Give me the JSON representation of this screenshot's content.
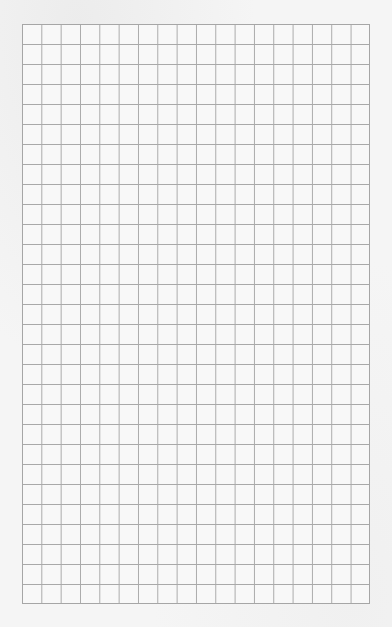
{
  "page": {
    "type": "graph-paper",
    "background_color": "#f5f5f5",
    "line_color": "#a9a9a9"
  },
  "grid": {
    "columns": 18,
    "rows": 29,
    "cell_width_px": 19.33,
    "cell_height_px": 20,
    "left_px": 22,
    "top_px": 24,
    "width_px": 348,
    "height_px": 580
  }
}
